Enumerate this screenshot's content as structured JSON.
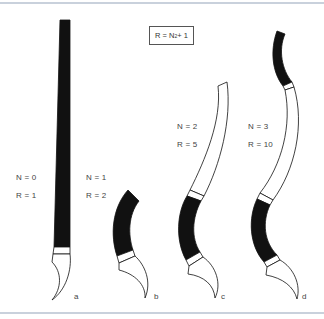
{
  "figure": {
    "formula": {
      "lhs": "R = N",
      "exp": "2",
      "rhs": " + 1"
    },
    "brushes": [
      {
        "letter": "a",
        "n_label": "N = 0",
        "r_label": "R = 1"
      },
      {
        "letter": "b",
        "n_label": "N = 1",
        "r_label": "R = 2"
      },
      {
        "letter": "c",
        "n_label": "N = 2",
        "r_label": "R = 5"
      },
      {
        "letter": "d",
        "n_label": "N = 3",
        "r_label": "R = 10"
      }
    ],
    "colors": {
      "ink": "#111111",
      "rule": "#c9d1dc",
      "background": "#ffffff"
    }
  }
}
